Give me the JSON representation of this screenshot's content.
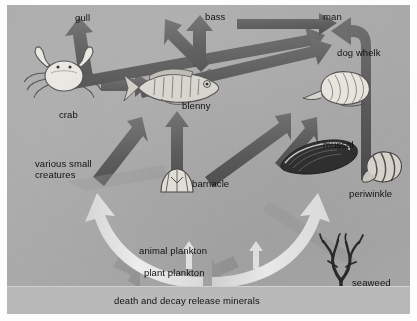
{
  "diagram": {
    "panel_color": "#a9a9a9",
    "arrow_color": "#5e5e5e",
    "recycle_arrow_color": "#efefef",
    "decay_band": {
      "label": "death and decay release minerals",
      "color": "#b9b9b9"
    }
  },
  "nodes": [
    {
      "id": "gull",
      "label": "gull",
      "kind": "text"
    },
    {
      "id": "bass",
      "label": "bass",
      "kind": "text"
    },
    {
      "id": "man",
      "label": "man",
      "kind": "text"
    },
    {
      "id": "dog_whelk",
      "label": "dog whelk",
      "kind": "illustration"
    },
    {
      "id": "crab",
      "label": "crab",
      "kind": "illustration"
    },
    {
      "id": "blenny",
      "label": "blenny",
      "kind": "illustration"
    },
    {
      "id": "mussel",
      "label": "mussel",
      "kind": "illustration"
    },
    {
      "id": "periwinkle",
      "label": "periwinkle",
      "kind": "illustration"
    },
    {
      "id": "barnacle",
      "label": "barnacle",
      "kind": "illustration"
    },
    {
      "id": "seaweed",
      "label": "seaweed",
      "kind": "illustration"
    },
    {
      "id": "small",
      "label": "various small\ncreatures",
      "kind": "text"
    },
    {
      "id": "zooplankton",
      "label": "animal plankton",
      "kind": "text"
    },
    {
      "id": "phytoplankton",
      "label": "plant plankton",
      "kind": "text"
    }
  ],
  "labels": {
    "gull": "gull",
    "bass": "bass",
    "man": "man",
    "dog_whelk": "dog whelk",
    "crab": "crab",
    "blenny": "blenny",
    "mussel": "mussel",
    "periwinkle": "periwinkle",
    "barnacle": "barnacle",
    "seaweed": "seaweed",
    "small_line1": "various small",
    "small_line2": "creatures",
    "animal_plankton": "animal plankton",
    "plant_plankton": "plant plankton",
    "decay": "death and decay release minerals"
  },
  "links": [
    {
      "from": "crab",
      "to": "gull",
      "style": "feed"
    },
    {
      "from": "crab",
      "to": "blenny",
      "style": "feed"
    },
    {
      "from": "crab",
      "to": "man",
      "style": "feed"
    },
    {
      "from": "blenny",
      "to": "bass",
      "style": "feed"
    },
    {
      "from": "blenny",
      "to": "gull",
      "style": "feed"
    },
    {
      "from": "bass",
      "to": "man",
      "style": "feed"
    },
    {
      "from": "barnacle",
      "to": "blenny",
      "style": "feed"
    },
    {
      "from": "barnacle",
      "to": "dog_whelk",
      "style": "feed"
    },
    {
      "from": "mussel",
      "to": "dog_whelk",
      "style": "feed"
    },
    {
      "from": "small",
      "to": "blenny",
      "style": "feed"
    },
    {
      "from": "small",
      "to": "crab",
      "style": "feed"
    },
    {
      "from": "periwinkle",
      "to": "man",
      "style": "feed"
    },
    {
      "from": "zooplankton",
      "to": "barnacle",
      "style": "feed"
    },
    {
      "from": "phytoplankton",
      "to": "zooplankton",
      "style": "feed"
    },
    {
      "from": "seaweed",
      "to": "periwinkle",
      "style": "feed"
    },
    {
      "from": "decay",
      "to": "small",
      "style": "recycle"
    },
    {
      "from": "decay",
      "to": "mussel",
      "style": "recycle"
    },
    {
      "from": "crab",
      "to": "decay",
      "style": "decay"
    },
    {
      "from": "seaweed",
      "to": "decay",
      "style": "decay"
    }
  ]
}
